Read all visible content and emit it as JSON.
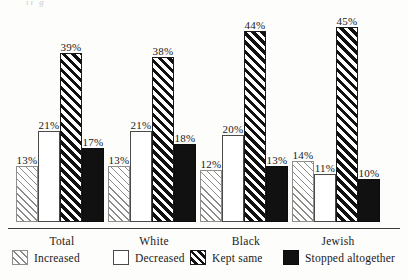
{
  "top_bleed_text": "ıı       ɡ",
  "legend": {
    "items": [
      {
        "label": "Increased",
        "pattern": "thin-diagonal-hatch",
        "x": 12
      },
      {
        "label": "Decreased",
        "pattern": "open-white",
        "x": 113
      },
      {
        "label": "Kept same",
        "pattern": "thick-diagonal-hatch",
        "x": 190
      },
      {
        "label": "Stopped altogether",
        "pattern": "solid-black",
        "x": 283
      }
    ]
  },
  "chart_data": {
    "type": "bar",
    "title": "",
    "subtitle": "",
    "xlabel": "",
    "ylabel": "",
    "ylim": [
      0,
      50
    ],
    "grid": false,
    "legend_position": "bottom",
    "value_labels": true,
    "value_suffix": "%",
    "categories": [
      "Total",
      "White",
      "Black",
      "Jewish"
    ],
    "series": [
      {
        "name": "Increased",
        "pattern": "thin-diagonal-hatch",
        "values": [
          13,
          13,
          12,
          14
        ]
      },
      {
        "name": "Decreased",
        "pattern": "open-white",
        "values": [
          21,
          21,
          20,
          11
        ]
      },
      {
        "name": "Kept same",
        "pattern": "thick-diagonal-hatch",
        "values": [
          39,
          38,
          44,
          45
        ]
      },
      {
        "name": "Stopped altogether",
        "pattern": "solid-black",
        "values": [
          17,
          18,
          13,
          10
        ]
      }
    ],
    "labels": [
      [
        "13%",
        "21%",
        "39%",
        "17%"
      ],
      [
        "13%",
        "21%",
        "38%",
        "18%"
      ],
      [
        "12%",
        "20%",
        "44%",
        "13%"
      ],
      [
        "14%",
        "11%",
        "45%",
        "10%"
      ]
    ]
  },
  "layout": {
    "group_left": [
      16,
      108,
      200,
      292
    ],
    "group_width": 92,
    "bar_width": 22,
    "px_per_percent": 4.33,
    "baseline_y": 222
  }
}
